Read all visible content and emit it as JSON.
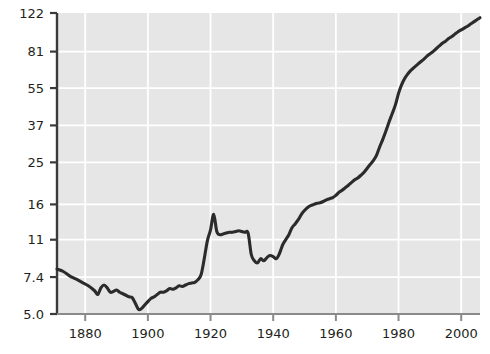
{
  "chart_data": {
    "type": "line",
    "title": "",
    "subtitle": "",
    "xlabel": "",
    "ylabel": "",
    "yscale": "log",
    "xscale": "linear",
    "grid": true,
    "legend": null,
    "xlim": [
      1871,
      2006
    ],
    "ylim": [
      5.0,
      122
    ],
    "xticks": [
      1880,
      1900,
      1920,
      1940,
      1960,
      1980,
      2000
    ],
    "xticklabels": [
      "1880",
      "1900",
      "1920",
      "1940",
      "1960",
      "1980",
      "2000"
    ],
    "yticks": [
      5.0,
      7.4,
      11,
      16,
      25,
      37,
      55,
      81,
      122
    ],
    "yticklabels": [
      "5.0",
      "7.4",
      "11",
      "16",
      "25",
      "37",
      "55",
      "81",
      "122"
    ],
    "line_color": "#2b2b2b",
    "line_width": 3.1,
    "plot_background": "#e6e6e6",
    "gridline_color": "#ffffff",
    "axis_color": "#3a3a3a",
    "series": [
      {
        "name": "series-1",
        "x": [
          1871,
          1873,
          1875,
          1877,
          1879,
          1881,
          1883,
          1884,
          1885,
          1886,
          1887,
          1888,
          1889,
          1890,
          1891,
          1892,
          1893,
          1894,
          1895,
          1896,
          1897,
          1898,
          1899,
          1900,
          1901,
          1902,
          1903,
          1904,
          1905,
          1906,
          1907,
          1908,
          1909,
          1910,
          1911,
          1912,
          1913,
          1914,
          1915,
          1916,
          1917,
          1918,
          1919,
          1920,
          1921,
          1922,
          1923,
          1924,
          1925,
          1926,
          1927,
          1928,
          1929,
          1930,
          1931,
          1932,
          1933,
          1934,
          1935,
          1936,
          1937,
          1938,
          1939,
          1940,
          1941,
          1942,
          1943,
          1944,
          1945,
          1946,
          1947,
          1948,
          1949,
          1950,
          1951,
          1952,
          1953,
          1954,
          1955,
          1956,
          1957,
          1958,
          1959,
          1960,
          1961,
          1962,
          1963,
          1964,
          1965,
          1966,
          1967,
          1968,
          1969,
          1970,
          1971,
          1972,
          1973,
          1974,
          1975,
          1976,
          1977,
          1978,
          1979,
          1980,
          1981,
          1982,
          1983,
          1984,
          1985,
          1986,
          1987,
          1988,
          1989,
          1990,
          1991,
          1992,
          1993,
          1994,
          1995,
          1996,
          1997,
          1998,
          1999,
          2000,
          2001,
          2002,
          2003,
          2004,
          2005,
          2006
        ],
        "y": [
          8.05,
          7.85,
          7.5,
          7.25,
          7.0,
          6.75,
          6.4,
          6.15,
          6.6,
          6.8,
          6.6,
          6.3,
          6.35,
          6.45,
          6.3,
          6.2,
          6.1,
          6.0,
          5.95,
          5.6,
          5.25,
          5.3,
          5.5,
          5.7,
          5.9,
          6.0,
          6.15,
          6.3,
          6.3,
          6.4,
          6.55,
          6.5,
          6.6,
          6.75,
          6.7,
          6.8,
          6.9,
          6.95,
          7.0,
          7.2,
          7.6,
          9.0,
          10.9,
          12.2,
          14.4,
          12.0,
          11.6,
          11.7,
          11.8,
          11.9,
          11.9,
          12.0,
          12.1,
          12.0,
          11.9,
          11.8,
          9.4,
          8.8,
          8.6,
          9.0,
          8.8,
          9.1,
          9.3,
          9.2,
          9.0,
          9.5,
          10.4,
          11.0,
          11.6,
          12.5,
          13.0,
          13.6,
          14.4,
          15.0,
          15.5,
          15.8,
          16.0,
          16.2,
          16.3,
          16.5,
          16.8,
          17.0,
          17.2,
          17.6,
          18.2,
          18.6,
          19.1,
          19.6,
          20.2,
          20.8,
          21.2,
          21.8,
          22.5,
          23.5,
          24.5,
          25.5,
          27.0,
          29.5,
          32.0,
          35.0,
          38.5,
          42.0,
          46.0,
          52.0,
          57.0,
          61.0,
          64.0,
          66.5,
          68.5,
          70.5,
          72.5,
          74.5,
          77.0,
          79.0,
          81.0,
          83.5,
          86.0,
          88.5,
          90.5,
          93.0,
          95.0,
          97.5,
          100.0,
          102.0,
          104.0,
          106.0,
          108.5,
          111.0,
          113.5,
          116.0
        ]
      }
    ]
  },
  "axes": {
    "y_axis_name": "y-axis",
    "x_axis_name": "x-axis"
  }
}
